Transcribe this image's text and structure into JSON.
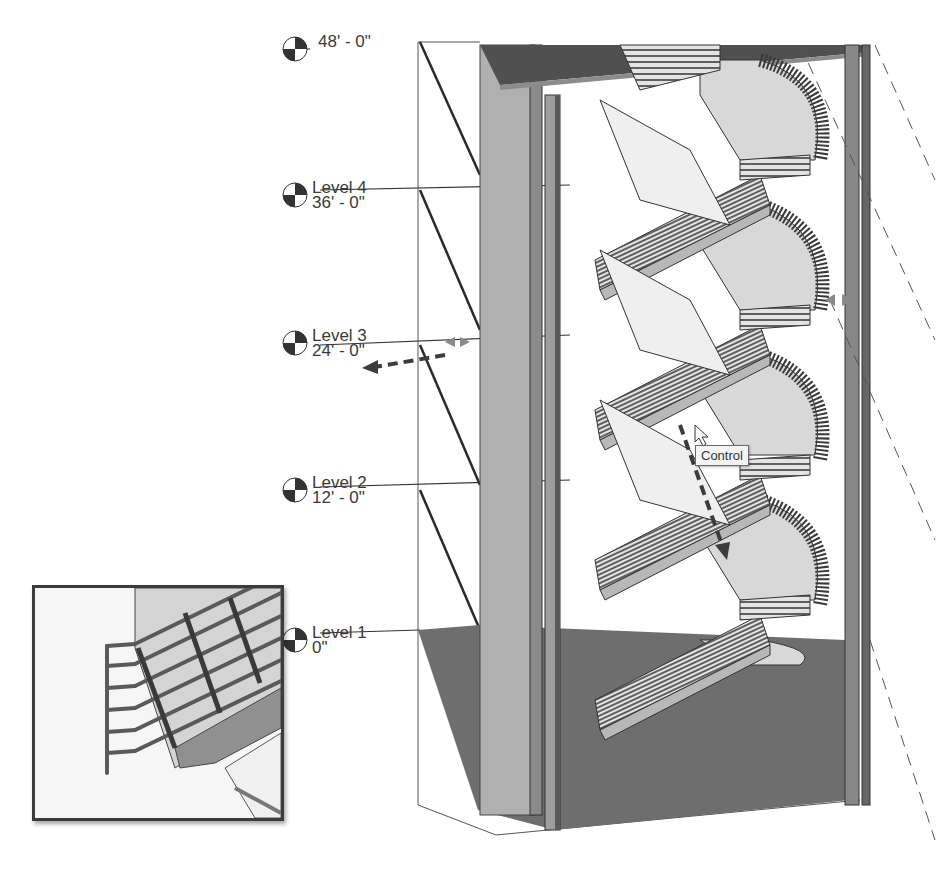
{
  "view": {
    "type": "3D stair view",
    "levels": [
      {
        "name": "Level 5",
        "elevation": "48' - 0\"",
        "partial": true
      },
      {
        "name": "Level 4",
        "elevation": "36' - 0\""
      },
      {
        "name": "Level 3",
        "elevation": "24' - 0\""
      },
      {
        "name": "Level 2",
        "elevation": "12' - 0\""
      },
      {
        "name": "Level 1",
        "elevation": "0\""
      }
    ],
    "tooltip": "Control",
    "controls": {
      "flip_arrows_left": "double-arrow-control",
      "flip_arrows_right": "double-arrow-control",
      "drag_arrow": "dashed-drag-arrow"
    },
    "inset": {
      "label": "railing detail inset"
    }
  },
  "colors": {
    "floor": "#6e6e6e",
    "wall": "#a8a8a8",
    "landing": "#d8d8d8",
    "rail": "#4a4a4a",
    "dashed": "#555555"
  }
}
